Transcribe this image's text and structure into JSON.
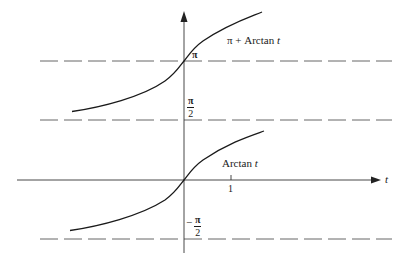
{
  "diagram": {
    "type": "function-graph",
    "axes": {
      "horizontal_label": "t",
      "tick_labels": [
        "1"
      ]
    },
    "curves": [
      {
        "name": "arctan",
        "label_prefix": "Arctan",
        "label_var": "t"
      },
      {
        "name": "pi-plus-arctan",
        "label_prefix": "π + Arctan",
        "label_var": "t"
      }
    ],
    "asymptotes": [
      {
        "name": "pi",
        "label": "π"
      },
      {
        "name": "half-pi",
        "label_num": "π",
        "label_den": "2"
      },
      {
        "name": "neg-half-pi",
        "label_sign": "−",
        "label_num": "π",
        "label_den": "2"
      }
    ],
    "colors": {
      "ink": "#1a1a1a",
      "dash": "#555555",
      "background": "#ffffff"
    }
  }
}
